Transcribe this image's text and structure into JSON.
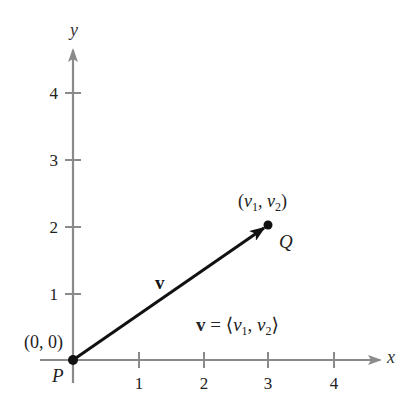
{
  "diagram": {
    "axes": {
      "x_label": "x",
      "y_label": "y",
      "x_ticks": [
        "1",
        "2",
        "3",
        "4"
      ],
      "y_ticks": [
        "1",
        "2",
        "3",
        "4"
      ],
      "axis_color": "#8a8a8a"
    },
    "points": {
      "P": {
        "name": "P",
        "coords_label": "(0, 0)"
      },
      "Q": {
        "name": "Q",
        "coords_label_v": "v",
        "sub1": "1",
        "sub2": "2"
      }
    },
    "vector": {
      "name": "v",
      "component_label": "v = ⟨v1, v2⟩",
      "color": "#111111"
    }
  }
}
